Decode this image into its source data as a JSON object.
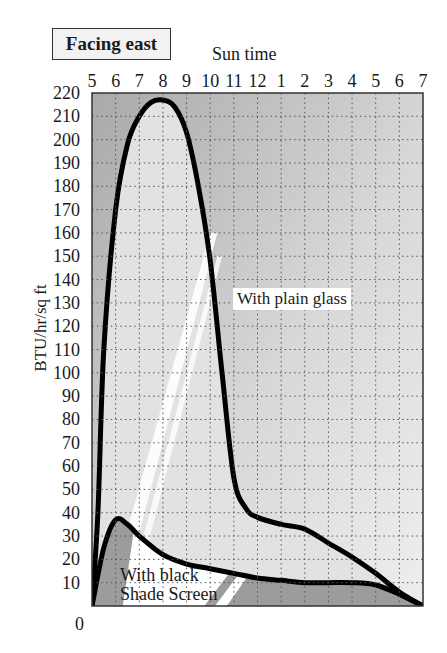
{
  "title": "Facing east",
  "x_axis_title": "Sun time",
  "y_axis_title": "BTU/hr/sq ft",
  "labels": {
    "plain": "With plain glass",
    "shade_line1": "With black",
    "shade_line2": "Shade Screen"
  },
  "colors": {
    "background_dark": "#a9a9a9",
    "background_light": "#eeeeee",
    "under_plain_fill": "#e2e2e2",
    "under_shade_fill": "#9c9c9c",
    "stripe": "#ffffff",
    "line": "#000000",
    "grid": "#555555"
  },
  "chart_data": {
    "type": "line",
    "title": "Facing east",
    "xlabel": "Sun time",
    "ylabel": "BTU/hr/sq ft",
    "x_tick_labels": [
      "5",
      "6",
      "7",
      "8",
      "9",
      "10",
      "11",
      "12",
      "1",
      "2",
      "3",
      "4",
      "5",
      "6",
      "7"
    ],
    "x_hours": [
      5,
      6,
      7,
      8,
      9,
      10,
      11,
      12,
      13,
      14,
      15,
      16,
      17,
      18,
      19
    ],
    "y_ticks": [
      0,
      10,
      20,
      30,
      40,
      50,
      60,
      70,
      80,
      90,
      100,
      110,
      120,
      130,
      140,
      150,
      160,
      170,
      180,
      190,
      200,
      210,
      220
    ],
    "ylim": [
      0,
      220
    ],
    "xlim": [
      5,
      19
    ],
    "grid": true,
    "legend": "inline annotations",
    "series": [
      {
        "name": "With plain glass",
        "x": [
          5,
          5.25,
          5.5,
          6,
          6.5,
          7,
          7.5,
          8,
          8.5,
          9,
          9.5,
          10,
          10.5,
          11,
          11.5,
          12,
          13,
          14,
          15,
          16,
          17,
          18,
          19
        ],
        "values": [
          0,
          40,
          110,
          170,
          198,
          210,
          216,
          217,
          214,
          203,
          180,
          148,
          100,
          55,
          42,
          38,
          35,
          33,
          27,
          21,
          14,
          6,
          0
        ]
      },
      {
        "name": "With black Shade Screen",
        "x": [
          5,
          5.5,
          6,
          6.5,
          7,
          8,
          9,
          10,
          11,
          12,
          13,
          14,
          15,
          16,
          17,
          18,
          19
        ],
        "values": [
          0,
          25,
          37,
          35,
          30,
          22,
          18,
          16,
          14,
          12,
          11,
          10,
          10,
          10,
          9,
          5,
          0
        ]
      }
    ]
  }
}
